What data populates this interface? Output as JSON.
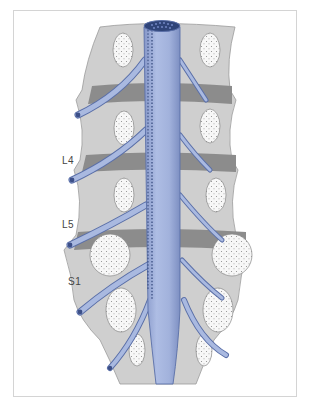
{
  "figure": {
    "labels": [
      {
        "id": "L4",
        "text": "L4",
        "x": 62,
        "y": 162
      },
      {
        "id": "L5",
        "text": "L5",
        "x": 62,
        "y": 225
      },
      {
        "id": "S1",
        "text": "S1",
        "x": 68,
        "y": 283
      }
    ],
    "colors": {
      "bone": "#cfcfcf",
      "bone_edge": "#9a9a9a",
      "disc": "#8c8c8c",
      "cancellous": "#f7f7f7",
      "nerve": "#a9b9e0",
      "nerve_edge": "#5a6fa8",
      "cord_top": "#2f4478",
      "frame": "#d4d4d4"
    }
  }
}
